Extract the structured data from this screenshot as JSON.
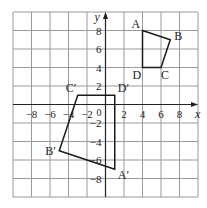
{
  "diagram": {
    "grid": {
      "xmin": -10,
      "xmax": 10,
      "ymin": -10,
      "ymax": 10,
      "step": 2,
      "left": 13,
      "top": 12,
      "cell": 18.5,
      "cols": 10,
      "rows": 10
    },
    "axes": {
      "x_label": "x",
      "y_label": "y",
      "origin_label": "0",
      "x_ticks": [
        "−8",
        "−6",
        "−4",
        "−2",
        "2",
        "4",
        "6",
        "8"
      ],
      "x_tick_values": [
        -8,
        -6,
        -4,
        -2,
        2,
        4,
        6,
        8
      ],
      "y_ticks": [
        "8",
        "6",
        "4",
        "2",
        "−2",
        "−4",
        "−6",
        "−8"
      ],
      "y_tick_values": [
        8,
        6,
        4,
        2,
        -2,
        -4,
        -6,
        -8
      ]
    },
    "shapes": [
      {
        "name": "ABCD",
        "vertices": [
          {
            "label": "A",
            "x": 4,
            "y": 8
          },
          {
            "label": "B",
            "x": 7,
            "y": 7
          },
          {
            "label": "C",
            "x": 6,
            "y": 4
          },
          {
            "label": "D",
            "x": 4,
            "y": 4
          }
        ]
      },
      {
        "name": "A'B'C'D'",
        "vertices": [
          {
            "label": "A′",
            "x": 1,
            "y": -7
          },
          {
            "label": "B′",
            "x": -5,
            "y": -5
          },
          {
            "label": "C′",
            "x": -3,
            "y": 1
          },
          {
            "label": "D′",
            "x": 1,
            "y": 1
          }
        ]
      }
    ],
    "colors": {
      "grid": "#9a9a9a",
      "axis": "#222222",
      "shape": "#1a1a1a"
    }
  }
}
